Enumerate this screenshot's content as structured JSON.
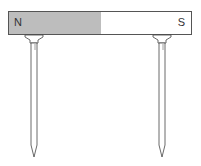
{
  "diagram": {
    "magnet": {
      "north_label": "N",
      "south_label": "S",
      "north_color": "#bdbdbd",
      "south_color": "#ffffff"
    },
    "nails": [
      {
        "position": "under north end"
      },
      {
        "position": "under south end"
      }
    ]
  }
}
